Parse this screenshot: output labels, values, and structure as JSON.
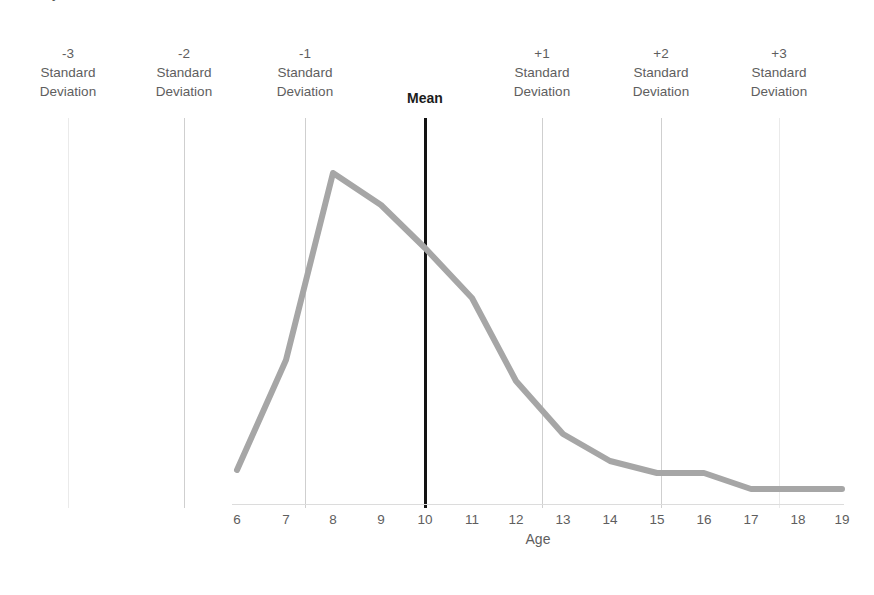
{
  "title_remnant": "y",
  "axis_title": "Age",
  "sd_markers": [
    {
      "num": "-3",
      "l1": "Standard",
      "l2": "Deviation",
      "x": 68,
      "kind": "faint"
    },
    {
      "num": "-2",
      "l1": "Standard",
      "l2": "Deviation",
      "x": 184,
      "kind": "mid"
    },
    {
      "num": "-1",
      "l1": "Standard",
      "l2": "Deviation",
      "x": 305,
      "kind": "mid"
    },
    {
      "num": "+1",
      "l1": "Standard",
      "l2": "Deviation",
      "x": 542,
      "kind": "mid"
    },
    {
      "num": "+2",
      "l1": "Standard",
      "l2": "Deviation",
      "x": 661,
      "kind": "mid"
    },
    {
      "num": "+3",
      "l1": "Standard",
      "l2": "Deviation",
      "x": 779,
      "kind": "faint"
    }
  ],
  "mean_marker": {
    "label": "Mean",
    "x": 425
  },
  "colors": {
    "line": "#a6a6a6",
    "mean_line": "#131313",
    "gridline": "#d9d9d9",
    "gridline_faint": "#eaeaea",
    "axis": "#dcdcdc",
    "text": "#5e5e5e",
    "background": "#ffffff"
  },
  "chart_data": {
    "type": "line",
    "title": "",
    "xlabel": "Age",
    "ylabel": "",
    "grid": true,
    "legend": "none",
    "xlim": [
      6,
      19
    ],
    "ylim": [
      0,
      1
    ],
    "x": [
      6,
      7,
      8,
      9,
      10,
      11,
      12,
      13,
      14,
      15,
      16,
      17,
      18,
      19
    ],
    "categories": [
      "6",
      "7",
      "8",
      "9",
      "10",
      "11",
      "12",
      "13",
      "14",
      "15",
      "16",
      "17",
      "18",
      "19"
    ],
    "values": [
      0.115,
      0.435,
      1.0,
      0.895,
      0.77,
      0.625,
      0.38,
      0.225,
      0.145,
      0.105,
      0.105,
      0.052,
      0.052,
      0.052
    ],
    "series": [
      {
        "name": "Age distribution",
        "color": "#a6a6a6",
        "values": [
          0.115,
          0.435,
          1.0,
          0.895,
          0.77,
          0.625,
          0.38,
          0.225,
          0.145,
          0.105,
          0.105,
          0.052,
          0.052,
          0.052
        ]
      }
    ],
    "pixel_points": [
      [
        237,
        470
      ],
      [
        286,
        360
      ],
      [
        333,
        173
      ],
      [
        381,
        205
      ],
      [
        425,
        248
      ],
      [
        472,
        298
      ],
      [
        516,
        381
      ],
      [
        563,
        434
      ],
      [
        610,
        461
      ],
      [
        657,
        473
      ],
      [
        704,
        473
      ],
      [
        751,
        489
      ],
      [
        798,
        489
      ],
      [
        842,
        489
      ]
    ],
    "annotations": [
      {
        "text": "-3 Standard Deviation",
        "x": 6.5
      },
      {
        "text": "-2 Standard Deviation",
        "x": 7.8
      },
      {
        "text": "-1 Standard Deviation",
        "x": 9.1
      },
      {
        "text": "Mean",
        "x": 10.4
      },
      {
        "text": "+1 Standard Deviation",
        "x": 11.7
      },
      {
        "text": "+2 Standard Deviation",
        "x": 13.0
      },
      {
        "text": "+3 Standard Deviation",
        "x": 14.3
      }
    ]
  }
}
